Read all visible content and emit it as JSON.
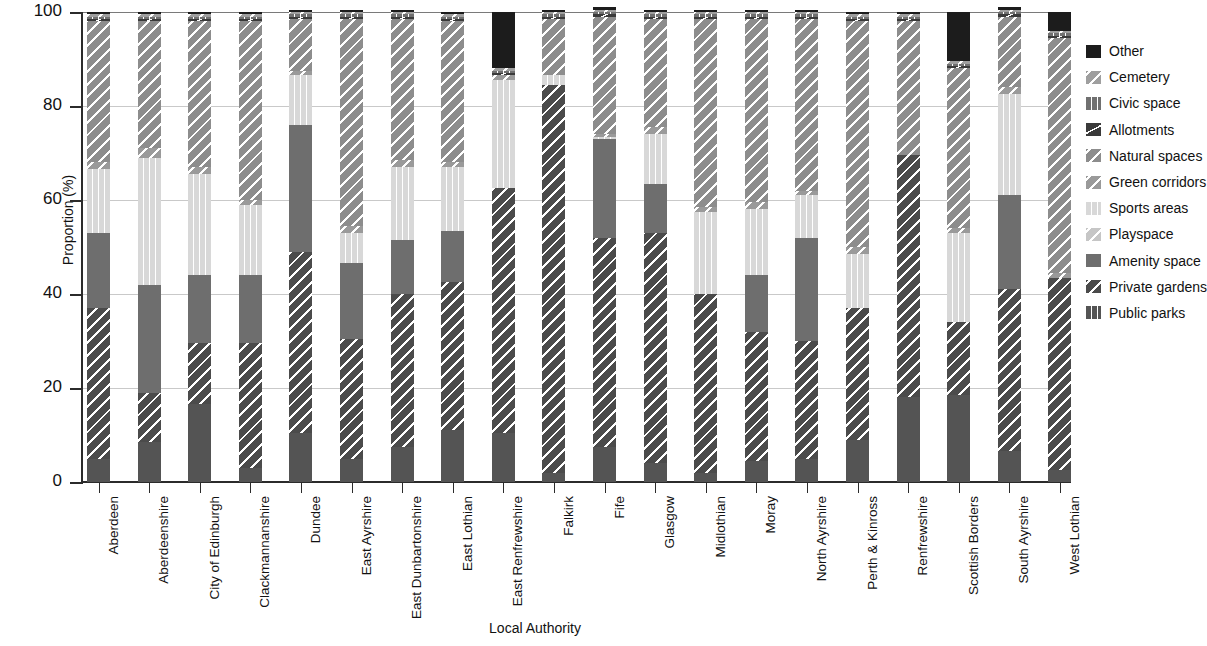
{
  "chart_data": {
    "type": "bar",
    "subtype": "stacked-bar-100",
    "title": "",
    "xlabel": "Local Authority",
    "ylabel": "Proportion (%)",
    "ylim": [
      0,
      100
    ],
    "yticks": [
      0,
      20,
      40,
      60,
      80,
      100
    ],
    "grid": true,
    "legend_position": "right",
    "stack_order_bottom_to_top": [
      "Public parks",
      "Private gardens",
      "Amenity space",
      "Playspace",
      "Sports areas",
      "Green corridors",
      "Natural spaces",
      "Allotments",
      "Civic space",
      "Cemetery",
      "Other"
    ],
    "categories": [
      "Aberdeen",
      "Aberdeenshire",
      "City of Edinburgh",
      "Clackmannanshire",
      "Dundee",
      "East Ayrshire",
      "East Dunbartonshire",
      "East Lothian",
      "East Renfrewshire",
      "Falkirk",
      "Fife",
      "Glasgow",
      "Midlothian",
      "Moray",
      "North Ayrshire",
      "Perth & Kinross",
      "Renfrewshire",
      "Scottish Borders",
      "South Ayrshire",
      "West Lothian"
    ],
    "series": [
      {
        "name": "Public parks",
        "color": "#545454",
        "pattern": "solid",
        "values": [
          5.0,
          8.5,
          16.5,
          3.0,
          10.5,
          5.0,
          7.5,
          11.0,
          10.5,
          2.0,
          7.5,
          4.0,
          2.0,
          4.5,
          5.0,
          9.0,
          18.0,
          18.5,
          6.5,
          2.5
        ]
      },
      {
        "name": "Private gardens",
        "color": "#4b4b4b",
        "pattern": "diag",
        "values": [
          32.0,
          10.5,
          13.0,
          26.5,
          38.5,
          25.5,
          32.5,
          31.5,
          52.0,
          82.5,
          44.5,
          49.0,
          38.0,
          27.5,
          25.0,
          28.0,
          51.5,
          15.5,
          34.5,
          41.0
        ]
      },
      {
        "name": "Amenity space",
        "color": "#6e6e6e",
        "pattern": "solid",
        "values": [
          16.0,
          23.0,
          14.5,
          14.5,
          27.0,
          16.0,
          11.5,
          11.0,
          0.0,
          0.0,
          21.0,
          10.5,
          0.0,
          12.0,
          22.0,
          0.0,
          0.0,
          0.0,
          20.0,
          0.0
        ]
      },
      {
        "name": "Playspace",
        "color": "#c6c6c6",
        "pattern": "diag",
        "values": [
          0.0,
          0.0,
          0.0,
          0.0,
          0.0,
          0.0,
          0.0,
          0.0,
          0.0,
          0.0,
          0.0,
          0.0,
          0.0,
          0.0,
          0.0,
          0.0,
          0.0,
          0.0,
          0.0,
          0.0
        ]
      },
      {
        "name": "Sports areas",
        "color": "#d8d8d8",
        "pattern": "vert",
        "values": [
          13.5,
          27.0,
          21.5,
          15.0,
          10.5,
          6.5,
          15.5,
          13.5,
          23.0,
          2.0,
          0.5,
          10.5,
          17.5,
          14.0,
          9.0,
          11.5,
          0.0,
          19.0,
          21.5,
          0.0
        ]
      },
      {
        "name": "Green corridors",
        "color": "#9a9a9a",
        "pattern": "diag",
        "values": [
          1.5,
          2.0,
          1.5,
          1.0,
          1.0,
          1.5,
          1.5,
          1.0,
          1.0,
          0.0,
          0.5,
          1.5,
          1.0,
          1.5,
          1.0,
          1.5,
          0.0,
          1.0,
          1.5,
          1.0
        ]
      },
      {
        "name": "Natural spaces",
        "color": "#8d8d8d",
        "pattern": "diag",
        "values": [
          30.0,
          27.0,
          31.0,
          38.0,
          11.0,
          44.0,
          30.0,
          30.0,
          0.0,
          12.0,
          25.0,
          23.0,
          40.0,
          39.0,
          36.5,
          48.0,
          28.5,
          34.0,
          15.0,
          50.0
        ]
      },
      {
        "name": "Allotments",
        "color": "#3a3a3a",
        "pattern": "corner",
        "values": [
          0.5,
          0.5,
          0.5,
          0.5,
          0.5,
          0.5,
          0.5,
          0.5,
          0.5,
          0.5,
          0.5,
          0.5,
          0.5,
          0.5,
          0.5,
          0.5,
          0.5,
          0.5,
          0.5,
          0.5
        ]
      },
      {
        "name": "Civic space",
        "color": "#707070",
        "pattern": "vert",
        "values": [
          0.5,
          0.5,
          0.5,
          0.5,
          0.5,
          0.5,
          0.5,
          0.5,
          0.5,
          0.5,
          0.5,
          0.5,
          0.5,
          0.5,
          0.5,
          0.5,
          0.5,
          0.5,
          0.5,
          0.5
        ]
      },
      {
        "name": "Cemetery",
        "color": "#9f9f9f",
        "pattern": "diag",
        "values": [
          0.5,
          0.5,
          0.5,
          0.5,
          0.5,
          0.5,
          0.5,
          0.5,
          0.5,
          0.5,
          0.5,
          0.5,
          0.5,
          0.5,
          0.5,
          0.5,
          0.5,
          0.5,
          0.5,
          0.5
        ]
      },
      {
        "name": "Other",
        "color": "#1c1c1c",
        "pattern": "solid",
        "values": [
          0.5,
          0.5,
          0.5,
          0.5,
          0.5,
          0.5,
          0.5,
          0.5,
          12.0,
          0.5,
          0.5,
          0.5,
          0.5,
          0.5,
          0.5,
          0.5,
          0.5,
          10.5,
          0.5,
          4.0
        ]
      }
    ],
    "legend_entries_top_to_bottom": [
      {
        "label": "Other",
        "color": "#1c1c1c",
        "pattern": "solid"
      },
      {
        "label": "Cemetery",
        "color": "#9f9f9f",
        "pattern": "diag"
      },
      {
        "label": "Civic space",
        "color": "#707070",
        "pattern": "vert"
      },
      {
        "label": "Allotments",
        "color": "#3a3a3a",
        "pattern": "corner"
      },
      {
        "label": "Natural spaces",
        "color": "#8d8d8d",
        "pattern": "diag"
      },
      {
        "label": "Green corridors",
        "color": "#9a9a9a",
        "pattern": "diag"
      },
      {
        "label": "Sports areas",
        "color": "#d8d8d8",
        "pattern": "vert"
      },
      {
        "label": "Playspace",
        "color": "#c6c6c6",
        "pattern": "diag"
      },
      {
        "label": "Amenity space",
        "color": "#6e6e6e",
        "pattern": "solid"
      },
      {
        "label": "Private gardens",
        "color": "#4b4b4b",
        "pattern": "diag"
      },
      {
        "label": "Public parks",
        "color": "#545454",
        "pattern": "vert"
      }
    ]
  }
}
